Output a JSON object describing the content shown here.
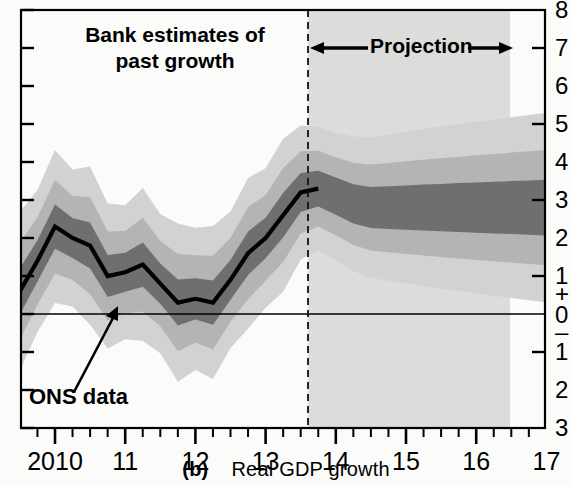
{
  "figure": {
    "caption_label": "(b)",
    "caption_text": "Real GDP growth",
    "annotations": {
      "past_line1": "Bank estimates of",
      "past_line2": "past growth",
      "projection": "Projection",
      "ons": "ONS data"
    }
  },
  "colors": {
    "background": "#fbfbfa",
    "projection_backdrop": "#dcdcda",
    "band_90": "#d2d2d0",
    "band_60": "#b4b4b2",
    "band_30": "#6f6f6f",
    "line": "#000000",
    "axis": "#000000",
    "zero_line": "#000000"
  },
  "chart_data": {
    "type": "area",
    "title": "Real GDP growth",
    "subtitle": "Bank of England fan chart — four-quarter growth, per cent",
    "xlabel": "",
    "ylabel": "",
    "grid": false,
    "legend_position": "none",
    "ylim": [
      -3,
      8
    ],
    "yticks": [
      8,
      7,
      6,
      5,
      4,
      3,
      2,
      1,
      0,
      -1,
      -2,
      -3
    ],
    "ytick_labels": [
      "8",
      "7",
      "6",
      "5",
      "4",
      "3",
      "2",
      "1",
      "+\n0\n–",
      "1",
      "2",
      "3"
    ],
    "ytick_major": [
      7,
      5,
      3,
      1,
      -1
    ],
    "xlim": [
      "2009 Q3",
      "2017 Q2"
    ],
    "xticks_major": [
      2010,
      2011,
      2012,
      2013,
      2014,
      2015,
      2016,
      2017
    ],
    "xtick_labels": [
      "2010",
      "11",
      "12",
      "13",
      "14",
      "15",
      "16",
      "17"
    ],
    "xticks_minor_per_year": 4,
    "projection_start": "2013 Q4",
    "quarters": [
      "2009Q3",
      "2009Q4",
      "2010Q1",
      "2010Q2",
      "2010Q3",
      "2010Q4",
      "2011Q1",
      "2011Q2",
      "2011Q3",
      "2011Q4",
      "2012Q1",
      "2012Q2",
      "2012Q3",
      "2012Q4",
      "2013Q1",
      "2013Q2",
      "2013Q3",
      "2013Q4",
      "2014Q1",
      "2014Q2",
      "2014Q3",
      "2014Q4",
      "2015Q1",
      "2015Q2",
      "2015Q3",
      "2015Q4",
      "2016Q1",
      "2016Q2",
      "2016Q3",
      "2016Q4",
      "2017Q1",
      "2017Q2"
    ],
    "series": [
      {
        "name": "ONS data / central estimate of past growth",
        "style": "thick black line",
        "values": [
          0.6,
          1.4,
          2.3,
          2.0,
          1.8,
          1.0,
          1.1,
          1.3,
          0.8,
          0.3,
          0.4,
          0.3,
          0.9,
          1.6,
          2.0,
          2.6,
          3.2,
          3.3
        ]
      },
      {
        "name": "central projection (mode)",
        "style": "darkest band centre",
        "values": [
          3.3,
          3.1,
          2.9,
          2.8,
          2.8,
          2.8,
          2.8,
          2.8,
          2.8,
          2.8,
          2.8,
          2.8,
          2.8,
          2.8
        ]
      }
    ],
    "bands": [
      {
        "name": "30% probability band",
        "shade": "#6f6f6f",
        "half_width_start": 0.45,
        "half_width_end": 0.75
      },
      {
        "name": "60% probability band",
        "shade": "#b4b4b2",
        "half_width_start": 0.95,
        "half_width_end": 1.55
      },
      {
        "name": "90% probability band",
        "shade": "#d2d2d0",
        "half_width_start": 1.55,
        "half_width_end": 2.55
      }
    ],
    "zero_line": 0
  }
}
